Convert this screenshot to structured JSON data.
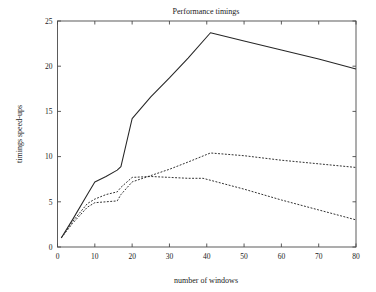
{
  "chart_data": {
    "type": "line",
    "title": "Performance timings",
    "xlabel": "number of windows",
    "ylabel": "timings speed-ups",
    "xlim": [
      0,
      80
    ],
    "ylim": [
      0,
      25
    ],
    "xticks": [
      0,
      10,
      20,
      30,
      40,
      50,
      60,
      70,
      80
    ],
    "yticks": [
      0,
      5,
      10,
      15,
      20,
      25
    ],
    "xtick_labels": [
      "0",
      "10",
      "20",
      "30",
      "40",
      "50",
      "60",
      "70",
      "80"
    ],
    "ytick_labels": [
      "0",
      "5",
      "10",
      "15",
      "20",
      "25"
    ],
    "grid": false,
    "legend": "none",
    "line_color": "#262626",
    "axis_color": "#4a4a4a",
    "background": "#ffffff",
    "series": [
      {
        "name": "solid",
        "style": "solid",
        "x": [
          1,
          4,
          8,
          10,
          13,
          16,
          17,
          20,
          25,
          30,
          35,
          41,
          50,
          60,
          70,
          80
        ],
        "values": [
          1.0,
          3.0,
          5.8,
          7.2,
          7.8,
          8.5,
          8.9,
          14.2,
          16.6,
          18.7,
          20.9,
          23.7,
          22.8,
          21.8,
          20.8,
          19.7
        ]
      },
      {
        "name": "dashed",
        "style": "dashed",
        "x": [
          1,
          4,
          8,
          10,
          13,
          16,
          17,
          20,
          25,
          30,
          35,
          41,
          50,
          60,
          70,
          80
        ],
        "values": [
          1.0,
          2.6,
          4.4,
          4.9,
          5.0,
          5.1,
          5.8,
          7.2,
          7.9,
          8.6,
          9.4,
          10.4,
          10.1,
          9.6,
          9.2,
          8.8
        ]
      },
      {
        "name": "dash-dot",
        "style": "dashdot",
        "x": [
          1,
          4,
          8,
          10,
          13,
          16,
          17,
          20,
          25,
          30,
          35,
          39,
          50,
          60,
          70,
          80
        ],
        "values": [
          1.0,
          2.8,
          4.8,
          5.3,
          5.8,
          6.1,
          6.6,
          7.7,
          7.8,
          7.7,
          7.6,
          7.6,
          6.4,
          5.2,
          4.1,
          3.0
        ]
      }
    ]
  }
}
